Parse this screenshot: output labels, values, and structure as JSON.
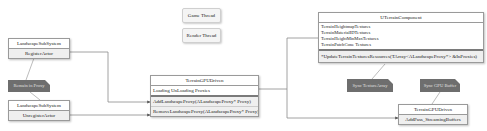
{
  "threads": {
    "game": "Game Thread",
    "render": "Render Thread"
  },
  "landscape_register": {
    "title": "LandscapeSubSystem",
    "method": "RegisterActor"
  },
  "landscape_unregister": {
    "title": "LandscapeSubSystem",
    "method": "UnregisterActor"
  },
  "note_remain": "Remain in Proxy",
  "terrain_gpu_main": {
    "title": "TerrainGPUDriven",
    "field": "Loading UnLoading Proxies",
    "methods": [
      "AddLandscapeProxy(ALandscapeProxy* Proxy)",
      "RemoveLandscapeProxy(ALandscapeProxy* Proxy)"
    ]
  },
  "terrain_component": {
    "title": "UTerrainComponent",
    "fields": [
      "TerrainHeightmapTextures",
      "TerrainMaterialIDTextures",
      "TerrainHeightMinMaxTextures",
      "TerrainPatchCone Textures"
    ],
    "method": "*UpdateTerrainTexturesResources(TArray<ALandscapeProxy*> &InProxies)"
  },
  "note_sync_texture": "Sync TextureArray",
  "note_sync_gpu": "Sync GPU Buffer",
  "terrain_gpu_small": {
    "title": "TerrainGPUDriven",
    "method": "AddPass_StreamingBuffers"
  },
  "colors": {
    "line": "#8a8a8a",
    "note": "#6e6e6e",
    "box_border": "#9a9a9a"
  }
}
